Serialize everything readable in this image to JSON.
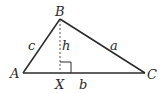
{
  "diagram": {
    "vertices": {
      "A": {
        "label": "A",
        "x": 23,
        "y": 73
      },
      "B": {
        "label": "B",
        "x": 60,
        "y": 19
      },
      "C": {
        "label": "C",
        "x": 145,
        "y": 73
      },
      "X": {
        "label": "X",
        "x": 60,
        "y": 73
      }
    },
    "sides": {
      "a": {
        "label": "a"
      },
      "b": {
        "label": "b"
      },
      "c": {
        "label": "c"
      },
      "h": {
        "label": "h"
      }
    },
    "colors": {
      "line": "#2a2a2a",
      "altitude": "#555555",
      "background": "#ffffff"
    }
  }
}
